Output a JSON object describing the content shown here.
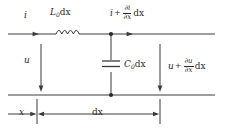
{
  "figure": {
    "stroke_color": "#3a3a3a",
    "text_color": "#2b2b2b",
    "background": "#ffffff"
  },
  "labels": {
    "current_in": "i",
    "inductor": {
      "base": "L",
      "subscript": "0",
      "suffix": "dx"
    },
    "current_out": {
      "base": "i",
      "operator": "+",
      "numerator": "∂i",
      "denominator": "∂x",
      "suffix": "dx"
    },
    "voltage_in": "u",
    "capacitor": {
      "base": "C",
      "subscript": "0",
      "suffix": "dx"
    },
    "voltage_out": {
      "base": "u",
      "operator": "+",
      "numerator": "∂u",
      "denominator": "∂x",
      "suffix": "dx"
    },
    "position": "x",
    "length": "dx"
  },
  "components": {
    "inductor_name": "inductor-coil",
    "capacitor_name": "capacitor-plates",
    "node_top_name": "node-dot-top",
    "node_bottom_name": "node-dot-bottom"
  }
}
